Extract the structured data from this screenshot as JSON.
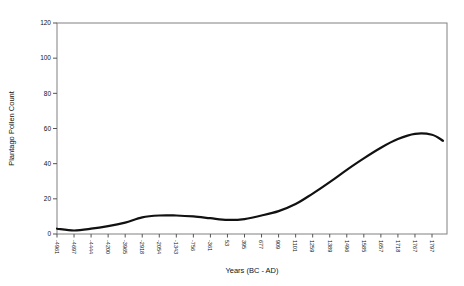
{
  "chart_data": {
    "type": "line",
    "title": "",
    "xlabel": "Years (BC - AD)",
    "ylabel": "Plantago Pollen Count",
    "categories": [
      "-4961",
      "-4697",
      "-4444",
      "-4200",
      "-3965",
      "-2918",
      "-2054",
      "-1343",
      "-756",
      "-361",
      "53",
      "395",
      "677",
      "909",
      "1101",
      "1259",
      "1389",
      "1496",
      "1585",
      "1657",
      "1718",
      "1767",
      "1797"
    ],
    "values": [
      3,
      2,
      3,
      4.5,
      6.5,
      9.5,
      10.5,
      10.5,
      10,
      9,
      8,
      8.5,
      10.5,
      13,
      17,
      23,
      29.5,
      36.5,
      43,
      49,
      54,
      57,
      56.5
    ],
    "curve_tail_value": 53,
    "ylim": [
      0,
      120
    ],
    "yticks": [
      0,
      20,
      40,
      60,
      80,
      100,
      120
    ],
    "grid": false,
    "legend": false,
    "line_color": "#111111",
    "frame_color": "#808080",
    "tick_color": "#555555",
    "background": "#ffffff"
  }
}
